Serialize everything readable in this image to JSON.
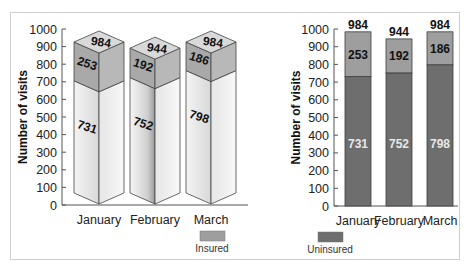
{
  "chart_data": [
    {
      "type": "bar",
      "style": "3d-stacked",
      "title": "",
      "xlabel": "",
      "ylabel": "Number of visits",
      "ylim": [
        0,
        1000
      ],
      "yticks": [
        0,
        100,
        200,
        300,
        400,
        500,
        600,
        700,
        800,
        900,
        1000
      ],
      "categories": [
        "January",
        "February",
        "March"
      ],
      "series": [
        {
          "name": "Uninsured",
          "values": [
            731,
            752,
            798
          ]
        },
        {
          "name": "Insured",
          "values": [
            253,
            192,
            186
          ]
        }
      ],
      "totals": [
        984,
        944,
        984
      ],
      "grid": false
    },
    {
      "type": "bar",
      "style": "stacked",
      "title": "",
      "xlabel": "",
      "ylabel": "Number of visits",
      "ylim": [
        0,
        1000
      ],
      "yticks": [
        0,
        100,
        200,
        300,
        400,
        500,
        600,
        700,
        800,
        900,
        1000
      ],
      "categories": [
        "January",
        "February",
        "March"
      ],
      "series": [
        {
          "name": "Uninsured",
          "values": [
            731,
            752,
            798
          ],
          "color": "#6e6e6e"
        },
        {
          "name": "Insured",
          "values": [
            253,
            192,
            186
          ],
          "color": "#9e9e9e"
        }
      ],
      "totals": [
        984,
        944,
        984
      ],
      "grid": false
    }
  ],
  "legend": {
    "items": [
      {
        "label": "Insured",
        "color": "#9e9e9e"
      },
      {
        "label": "Uninsured",
        "color": "#6e6e6e"
      }
    ]
  }
}
